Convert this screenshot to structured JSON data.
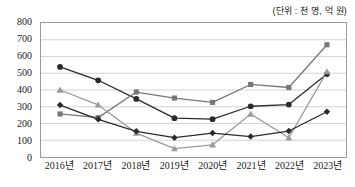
{
  "chart_data": {
    "type": "line",
    "title": "",
    "subtitle": "",
    "unit_note": "(단위 : 천 명, 억 원)",
    "xlabel": "",
    "ylabel": "",
    "categories": [
      "2016년",
      "2017년",
      "2018년",
      "2019년",
      "2020년",
      "2021년",
      "2022년",
      "2023년"
    ],
    "ylim": [
      0,
      800
    ],
    "ytick_step": 100,
    "yticks": [
      "800",
      "700",
      "600",
      "500",
      "400",
      "300",
      "200",
      "100",
      "0"
    ],
    "grid": true,
    "legend": "none",
    "series": [
      {
        "name": "series-1-circle",
        "marker": "circle",
        "color": "#2b2b2b",
        "values": [
          538,
          458,
          347,
          232,
          226,
          303,
          313,
          495
        ]
      },
      {
        "name": "series-2-square",
        "marker": "square",
        "color": "#777777",
        "values": [
          257,
          235,
          388,
          352,
          326,
          433,
          415,
          670
        ]
      },
      {
        "name": "series-3-triangle",
        "marker": "triangle",
        "color": "#9a9a9a",
        "values": [
          400,
          311,
          143,
          50,
          73,
          257,
          115,
          510
        ]
      },
      {
        "name": "series-4-diamond",
        "marker": "diamond",
        "color": "#2b2b2b",
        "values": [
          310,
          225,
          153,
          115,
          143,
          122,
          155,
          270
        ]
      }
    ]
  }
}
